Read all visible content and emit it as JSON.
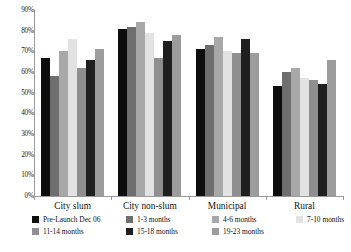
{
  "chart_data": {
    "type": "bar",
    "title": "",
    "xlabel": "",
    "ylabel": "",
    "ylim": [
      0,
      90
    ],
    "ytick_step": 10,
    "grid": false,
    "legend_position": "bottom",
    "categories": [
      "City slum",
      "City non-slum",
      "Municipal",
      "Rural"
    ],
    "ytick_labels": [
      "90%",
      "80%",
      "70%",
      "60%",
      "50%",
      "40%",
      "30%",
      "20%",
      "10%",
      "0%"
    ],
    "series": [
      {
        "name": "Pre-Launch Dec 06",
        "color": "#0d0d0d",
        "values": [
          67,
          81,
          71,
          53
        ]
      },
      {
        "name": "1-3 months",
        "color": "#6e6e6e",
        "values": [
          58,
          82,
          73,
          60
        ]
      },
      {
        "name": "4-6 months",
        "color": "#a8a8a8",
        "values": [
          70,
          84,
          77,
          62
        ]
      },
      {
        "name": "7-10 months",
        "color": "#e2e2e2",
        "values": [
          76,
          79,
          70,
          57
        ]
      },
      {
        "name": "11-14 months",
        "color": "#8f8f8f",
        "values": [
          62,
          67,
          69,
          56
        ]
      },
      {
        "name": "15-18 months",
        "color": "#1f1f1f",
        "values": [
          66,
          75,
          76,
          54
        ]
      },
      {
        "name": "19-23 months",
        "color": "#9c9c9c",
        "values": [
          71,
          78,
          69,
          66
        ]
      }
    ]
  },
  "legend": {
    "rows": [
      [
        "Pre-Launch Dec 06",
        "1-3 months",
        "4-6 months",
        "7-10 months"
      ],
      [
        "11-14 months",
        "15-18 months",
        "19-23 months"
      ]
    ]
  }
}
